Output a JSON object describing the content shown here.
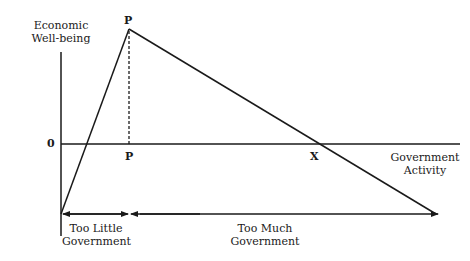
{
  "diagram": {
    "y_axis_label_line1": "Economic",
    "y_axis_label_line2": "Well-being",
    "x_axis_label_line1": "Government",
    "x_axis_label_line2": "Activity",
    "origin_label": "0",
    "peak_label": "P",
    "peak_axis_label": "P",
    "crossing_label": "X",
    "too_little_line1": "Too Little",
    "too_little_line2": "Government",
    "too_much_line1": "Too Much",
    "too_much_line2": "Government",
    "line_color": "#1a1a1a"
  }
}
